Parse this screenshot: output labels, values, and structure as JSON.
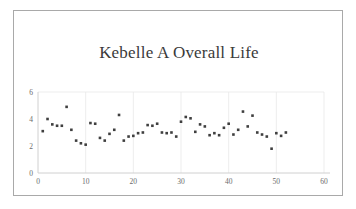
{
  "chart_data": {
    "type": "scatter",
    "title": "Kebelle A Overall Life Satisfaction/QOL⋯",
    "title_line1": "Kebelle A Overall Life",
    "title_line2": "Satisfaction/QOL⋯",
    "xlabel": "",
    "ylabel": "",
    "xlim": [
      0,
      60
    ],
    "ylim": [
      0,
      6
    ],
    "xticks": [
      0,
      10,
      20,
      30,
      40,
      50,
      60
    ],
    "yticks": [
      0,
      2,
      4,
      6
    ],
    "xtick_labels": [
      "0",
      "10",
      "20",
      "30",
      "40",
      "50",
      "60"
    ],
    "ytick_labels": [
      "0",
      "2",
      "4",
      "6"
    ],
    "grid": "vertical-major-light",
    "legend": "none",
    "marker": {
      "shape": "square",
      "color": "#3f3f3f",
      "size_px": 2.6
    },
    "series": [
      {
        "name": "Overall Life Satisfaction/QOL",
        "x": [
          1,
          2,
          3,
          4,
          5,
          6,
          7,
          8,
          9,
          10,
          11,
          12,
          13,
          14,
          15,
          16,
          17,
          18,
          19,
          20,
          21,
          22,
          23,
          24,
          25,
          26,
          27,
          28,
          29,
          30,
          31,
          32,
          33,
          34,
          35,
          36,
          37,
          38,
          39,
          40,
          41,
          42,
          43,
          44,
          45,
          46,
          47,
          48,
          49,
          50,
          51,
          52
        ],
        "y": [
          3.1,
          4.0,
          3.6,
          3.5,
          3.5,
          4.9,
          3.2,
          2.4,
          2.2,
          2.1,
          3.7,
          3.65,
          2.6,
          2.4,
          2.9,
          3.2,
          4.3,
          2.4,
          2.7,
          2.75,
          2.95,
          3.0,
          3.55,
          3.5,
          3.65,
          3.0,
          2.95,
          3.0,
          2.7,
          3.8,
          4.15,
          4.05,
          3.05,
          3.6,
          3.45,
          2.8,
          2.95,
          2.8,
          3.35,
          3.65,
          2.85,
          3.2,
          4.55,
          3.45,
          4.25,
          3.0,
          2.85,
          2.7,
          1.8,
          2.95,
          2.75,
          3.0
        ]
      }
    ],
    "extra_points_note": ""
  },
  "frame": {
    "border_color": "#a9a9a9",
    "background": "#ffffff",
    "gridline_color": "#e8e8e8",
    "axis_color": "#d0d0d0",
    "tick_label_color": "#6b6b6b",
    "title_color": "#3a3a3a"
  }
}
